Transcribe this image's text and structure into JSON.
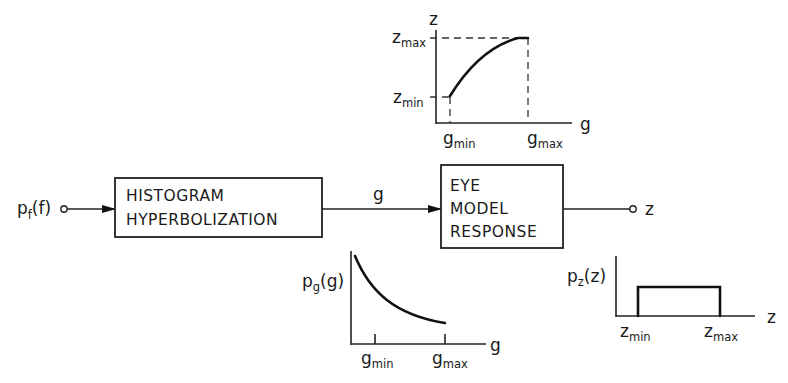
{
  "diagram": {
    "input": {
      "label_main": "p",
      "label_sub": "f",
      "label_arg": "(f)"
    },
    "output": {
      "label": "z"
    },
    "blocks": [
      {
        "id": "histogram-hyperbolization",
        "lines": [
          "HISTOGRAM",
          "HYPERBOLIZATION"
        ]
      },
      {
        "id": "eye-model-response",
        "lines": [
          "EYE",
          "MODEL",
          "RESPONSE"
        ]
      }
    ],
    "connections": [
      {
        "from": "input",
        "to": "histogram-hyperbolization",
        "label": ""
      },
      {
        "from": "histogram-hyperbolization",
        "to": "eye-model-response",
        "label": "g"
      },
      {
        "from": "eye-model-response",
        "to": "output",
        "label": ""
      }
    ]
  },
  "plots": {
    "eye_response": {
      "type": "line",
      "y_axis_label": "z",
      "x_axis_label": "g",
      "y_ticks": [
        {
          "main": "z",
          "sub": "max"
        },
        {
          "main": "z",
          "sub": "min"
        }
      ],
      "x_ticks": [
        {
          "main": "g",
          "sub": "min"
        },
        {
          "main": "g",
          "sub": "max"
        }
      ],
      "shape": "concave increasing curve from (g_min, z_min) to (g_max, z_max)"
    },
    "hyperbolic_pdf": {
      "type": "line",
      "y_axis_label": {
        "main": "p",
        "sub": "g",
        "arg": "(g)"
      },
      "x_axis_label": "g",
      "x_ticks": [
        {
          "main": "g",
          "sub": "min"
        },
        {
          "main": "g",
          "sub": "max"
        }
      ],
      "shape": "decreasing hyperbolic curve"
    },
    "uniform_pdf": {
      "type": "line",
      "y_axis_label": {
        "main": "p",
        "sub": "z",
        "arg": "(z)"
      },
      "x_axis_label": "z",
      "x_ticks": [
        {
          "main": "z",
          "sub": "min"
        },
        {
          "main": "z",
          "sub": "max"
        }
      ],
      "shape": "rectangular (uniform) between z_min and z_max"
    }
  }
}
